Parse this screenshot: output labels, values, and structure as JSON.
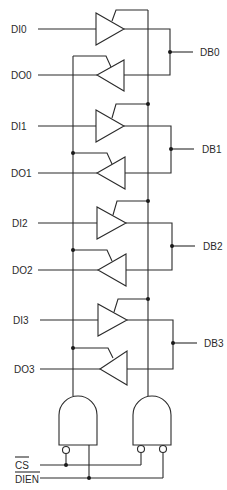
{
  "diagram": {
    "type": "bidirectional bus transceiver logic",
    "inputs": [
      {
        "label": "DI0",
        "y": 29
      },
      {
        "label": "DI1",
        "y": 126
      },
      {
        "label": "DI2",
        "y": 223
      },
      {
        "label": "DI3",
        "y": 320
      }
    ],
    "outputs": [
      {
        "label": "DO0",
        "y": 75
      },
      {
        "label": "DO1",
        "y": 173
      },
      {
        "label": "DO2",
        "y": 270
      },
      {
        "label": "DO3",
        "y": 366
      }
    ],
    "bus": [
      {
        "label": "DB0",
        "y": 52
      },
      {
        "label": "DB1",
        "y": 149
      },
      {
        "label": "DB2",
        "y": 246
      },
      {
        "label": "DB3",
        "y": 343
      }
    ],
    "control": {
      "cs_label": "CS",
      "dien_label": "DIEN"
    },
    "colors": {
      "line": "#2b2b2b",
      "background": "#ffffff"
    }
  }
}
